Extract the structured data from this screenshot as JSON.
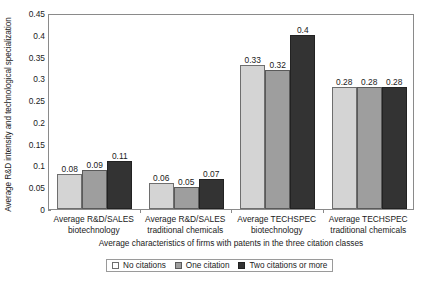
{
  "chart_data": {
    "type": "bar",
    "title": "",
    "subtitle": "",
    "xlabel": "Average characteristics of firms with patents in the three citation classes",
    "ylabel": "Average R&D intensity and technological specialization",
    "ylim": [
      0,
      0.45
    ],
    "yticks": [
      "0",
      "0.05",
      "0.1",
      "0.15",
      "0.2",
      "0.25",
      "0.3",
      "0.35",
      "0.4",
      "0.45"
    ],
    "ytick_values": [
      0,
      0.05,
      0.1,
      0.15,
      0.2,
      0.25,
      0.3,
      0.35,
      0.4,
      0.45
    ],
    "grid": false,
    "legend_position": "bottom",
    "categories": [
      "Average R&D/SALES biotechnology",
      "Average R&D/SALES traditional chemicals",
      "Average TECHSPEC biotechnology",
      "Average TECHSPEC traditional chemicals"
    ],
    "category_lines": [
      [
        "Average R&D/SALES",
        "biotechnology"
      ],
      [
        "Average R&D/SALES",
        "traditional chemicals"
      ],
      [
        "Average TECHSPEC",
        "biotechnology"
      ],
      [
        "Average TECHSPEC",
        "traditional chemicals"
      ]
    ],
    "series": [
      {
        "name": "No citations",
        "color": "#d4d4d4",
        "values": [
          0.08,
          0.06,
          0.33,
          0.28
        ],
        "labels": [
          "0.08",
          "0.06",
          "0.33",
          "0.28"
        ]
      },
      {
        "name": "One citation",
        "color": "#9e9e9e",
        "values": [
          0.09,
          0.05,
          0.32,
          0.28
        ],
        "labels": [
          "0.09",
          "0.05",
          "0.32",
          "0.28"
        ]
      },
      {
        "name": "Two citations or more",
        "color": "#333333",
        "values": [
          0.11,
          0.07,
          0.4,
          0.28
        ],
        "labels": [
          "0.11",
          "0.07",
          "0.4",
          "0.28"
        ]
      }
    ]
  },
  "legend": {
    "items": [
      {
        "label": "No citations"
      },
      {
        "label": "One citation"
      },
      {
        "label": "Two citations or more"
      }
    ]
  }
}
